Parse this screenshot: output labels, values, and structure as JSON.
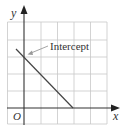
{
  "diagram": {
    "type": "coordinate-graph",
    "axes": {
      "x_label": "x",
      "y_label": "y",
      "origin_label": "O"
    },
    "grid": {
      "columns": 6,
      "rows": 6,
      "line_color": "#c8c8c8"
    },
    "line": {
      "description": "straight line with negative slope crossing the y-axis",
      "color": "#444444"
    },
    "annotation": {
      "label": "Intercept",
      "arrow_color": "#9a9a9a"
    }
  }
}
